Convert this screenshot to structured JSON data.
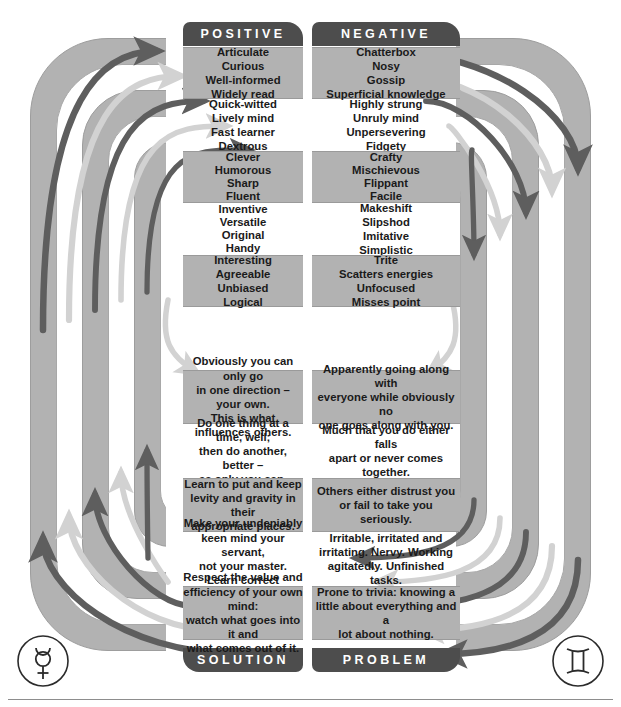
{
  "diagram": {
    "title_tabs": {
      "top_left": "POSITIVE",
      "top_right": "NEGATIVE",
      "bottom_left": "SOLUTION",
      "bottom_right": "PROBLEM"
    },
    "symbols": {
      "left": "mercury-symbol",
      "right": "gemini-symbol"
    },
    "colors": {
      "band_gray": "#b2b2b2",
      "band_white": "#ffffff",
      "tab_dark": "#4d4d4d",
      "arrow_dark": "#5e5e5e",
      "arrow_light": "#d2d2d2",
      "text": "#1a1a1a",
      "outline": "#9d9d9d"
    },
    "rows": [
      {
        "shaded": true,
        "left": [
          "Articulate",
          "Curious",
          "Well-informed",
          "Widely read"
        ],
        "right": [
          "Chatterbox",
          "Nosy",
          "Gossip",
          "Superficial knowledge"
        ]
      },
      {
        "shaded": false,
        "left": [
          "Quick-witted",
          "Lively mind",
          "Fast learner",
          "Dextrous"
        ],
        "right": [
          "Highly strung",
          "Unruly mind",
          "Unpersevering",
          "Fidgety"
        ]
      },
      {
        "shaded": true,
        "left": [
          "Clever",
          "Humorous",
          "Sharp",
          "Fluent"
        ],
        "right": [
          "Crafty",
          "Mischievous",
          "Flippant",
          "Facile"
        ]
      },
      {
        "shaded": false,
        "left": [
          "Inventive",
          "Versatile",
          "Original",
          "Handy"
        ],
        "right": [
          "Makeshift",
          "Slipshod",
          "Imitative",
          "Simplistic"
        ]
      },
      {
        "shaded": true,
        "left": [
          "Interesting",
          "Agreeable",
          "Unbiased",
          "Logical"
        ],
        "right": [
          "Trite",
          "Scatters energies",
          "Unfocused",
          "Misses point"
        ]
      },
      {
        "shaded": true,
        "left": [
          "Obviously you can only go",
          "in one direction – your own.",
          "This is what influences others."
        ],
        "right": [
          "Apparently going along with",
          "everyone while obviously no",
          "one goes along with you."
        ]
      },
      {
        "shaded": false,
        "left": [
          "Do one thing at a time, well;",
          "then do another, better –",
          "as only you can."
        ],
        "right": [
          "Much that you do either falls",
          "apart or never comes",
          "together."
        ]
      },
      {
        "shaded": true,
        "left": [
          "Learn to put and keep",
          "levity and gravity in their",
          "appropriate places."
        ],
        "right": [
          "Others either distrust you",
          "or fail to take you seriously."
        ]
      },
      {
        "shaded": false,
        "left": [
          "Make your undeniably",
          "keen mind your servant,",
          "not your master.",
          "Learn correct breathing."
        ],
        "right": [
          "Irritable, irritated and",
          "irritating. Nervy. Working",
          "agitatedly. Unfinished tasks."
        ]
      },
      {
        "shaded": true,
        "left": [
          "Respect the value and",
          "efficiency of your own mind:",
          "watch what goes into it and",
          "what comes out of it."
        ],
        "right": [
          "Prone to trivia: knowing a",
          "little about everything and a",
          "lot about nothing."
        ]
      }
    ]
  }
}
